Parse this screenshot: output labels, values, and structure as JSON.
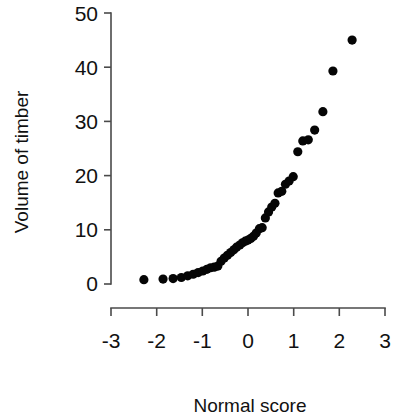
{
  "figure": {
    "background_color": "#ffffff",
    "point_color": "#050505",
    "axis_color": "#4a4a4a",
    "x_axis_label": "Normal score",
    "y_axis_label": "Volume of timber"
  },
  "chart_data": {
    "type": "scatter",
    "title": "",
    "xlabel": "Normal score",
    "ylabel": "Volume of timber",
    "xlim": [
      -3,
      3
    ],
    "ylim": [
      0,
      50
    ],
    "xticks": [
      -3,
      -2,
      -1,
      0,
      1,
      2,
      3
    ],
    "xtick_labels": [
      "-3",
      "-2",
      "-1",
      "0",
      "1",
      "2",
      "3"
    ],
    "yticks": [
      0,
      10,
      20,
      30,
      40,
      50
    ],
    "ytick_labels": [
      "0",
      "10",
      "20",
      "30",
      "40",
      "50"
    ],
    "grid": false,
    "legend": false,
    "marker": "filled-circle",
    "marker_size_px": 4.6,
    "n_points": 36,
    "x": [
      -2.28,
      -1.86,
      -1.64,
      -1.46,
      -1.32,
      -1.2,
      -1.09,
      -0.99,
      -0.9,
      -0.82,
      -0.74,
      -0.66,
      -0.59,
      -0.52,
      -0.45,
      -0.38,
      -0.31,
      -0.25,
      -0.18,
      -0.12,
      -0.06,
      0.0,
      0.06,
      0.12,
      0.18,
      0.25,
      0.31,
      0.38,
      0.45,
      0.52,
      0.59,
      0.66,
      0.74,
      0.82,
      0.9,
      0.99
    ],
    "y": [
      0.8,
      0.9,
      1.0,
      1.2,
      1.5,
      1.8,
      2.1,
      2.4,
      2.7,
      3.0,
      3.1,
      3.3,
      4.2,
      4.8,
      5.3,
      5.8,
      6.3,
      6.8,
      7.2,
      7.6,
      7.9,
      8.1,
      8.4,
      8.8,
      9.4,
      10.2,
      10.4,
      12.2,
      13.3,
      14.2,
      14.9,
      16.8,
      17.1,
      18.4,
      19.0,
      19.8
    ],
    "x_upper_tail": [
      1.09,
      1.2,
      1.32,
      1.46,
      1.64,
      1.86,
      2.28
    ],
    "y_upper_tail": [
      24.4,
      26.4,
      26.6,
      28.4,
      31.8,
      39.3,
      45.0
    ],
    "series": [
      {
        "name": "Volume of timber quantiles",
        "points": [
          [
            -2.28,
            0.8
          ],
          [
            -1.86,
            0.9
          ],
          [
            -1.64,
            1.0
          ],
          [
            -1.46,
            1.2
          ],
          [
            -1.32,
            1.5
          ],
          [
            -1.2,
            1.8
          ],
          [
            -1.09,
            2.1
          ],
          [
            -0.99,
            2.4
          ],
          [
            -0.9,
            2.7
          ],
          [
            -0.82,
            3.0
          ],
          [
            -0.74,
            3.1
          ],
          [
            -0.66,
            3.3
          ],
          [
            -0.59,
            4.2
          ],
          [
            -0.52,
            4.8
          ],
          [
            -0.45,
            5.3
          ],
          [
            -0.38,
            5.8
          ],
          [
            -0.31,
            6.3
          ],
          [
            -0.25,
            6.8
          ],
          [
            -0.18,
            7.2
          ],
          [
            -0.12,
            7.6
          ],
          [
            -0.06,
            7.9
          ],
          [
            0.0,
            8.1
          ],
          [
            0.06,
            8.4
          ],
          [
            0.12,
            8.8
          ],
          [
            0.18,
            9.4
          ],
          [
            0.25,
            10.2
          ],
          [
            0.31,
            10.4
          ],
          [
            0.38,
            12.2
          ],
          [
            0.45,
            13.3
          ],
          [
            0.52,
            14.2
          ],
          [
            0.59,
            14.9
          ],
          [
            0.66,
            16.8
          ],
          [
            0.74,
            17.1
          ],
          [
            0.82,
            18.4
          ],
          [
            0.9,
            19.0
          ],
          [
            0.99,
            19.8
          ],
          [
            1.09,
            24.4
          ],
          [
            1.2,
            26.4
          ],
          [
            1.32,
            26.6
          ],
          [
            1.46,
            28.4
          ],
          [
            1.64,
            31.8
          ],
          [
            1.86,
            39.3
          ],
          [
            2.28,
            45.0
          ]
        ]
      }
    ]
  }
}
